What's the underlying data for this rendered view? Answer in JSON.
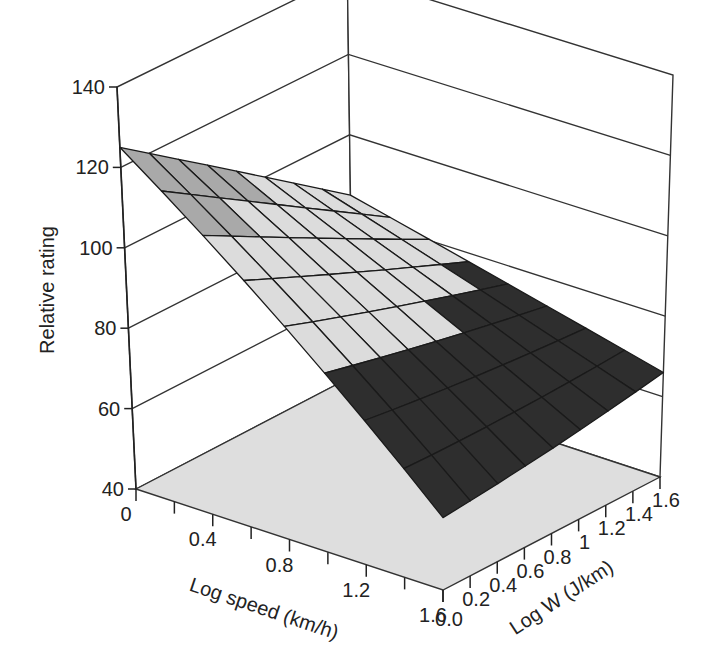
{
  "chart_data": {
    "type": "surface3d",
    "title": "",
    "zlabel": "Relative rating",
    "xlabel": "Log speed (km/h)",
    "ylabel": "Log W (J/km)",
    "zlim": [
      40,
      140
    ],
    "xlim": [
      0,
      1.6
    ],
    "ylim": [
      0,
      1.6
    ],
    "z_ticks": [
      "40",
      "60",
      "80",
      "100",
      "120",
      "140"
    ],
    "x_ticks": [
      "0",
      "0.4",
      "0.8",
      "1.2",
      "1.6"
    ],
    "y_ticks": [
      "0.0",
      "0.2",
      "0.4",
      "0.6",
      "0.8",
      "1",
      "1.2",
      "1.4",
      "1.6"
    ],
    "grid": true,
    "x": [
      0,
      0.2,
      0.4,
      0.6,
      0.8,
      1.0,
      1.2,
      1.4,
      1.6
    ],
    "y": [
      0,
      0.2,
      0.4,
      0.6,
      0.8,
      1.0,
      1.2,
      1.4,
      1.6
    ],
    "corner_values": {
      "speed0_w0": 125,
      "speed0_w1.6": 85,
      "speed1.6_w0": 58,
      "speed1.6_w1.6": 66
    },
    "color_bands": [
      {
        "min": 120,
        "max": 140,
        "color": "#111111"
      },
      {
        "min": 104,
        "max": 120,
        "color": "#a9a9a9"
      },
      {
        "min": 80,
        "max": 104,
        "color": "#dcdcdc"
      },
      {
        "min": 60,
        "max": 80,
        "color": "#2e2e2e"
      },
      {
        "min": 40,
        "max": 60,
        "color": "#7a7a7a"
      }
    ],
    "floor_color": "#dedede"
  }
}
